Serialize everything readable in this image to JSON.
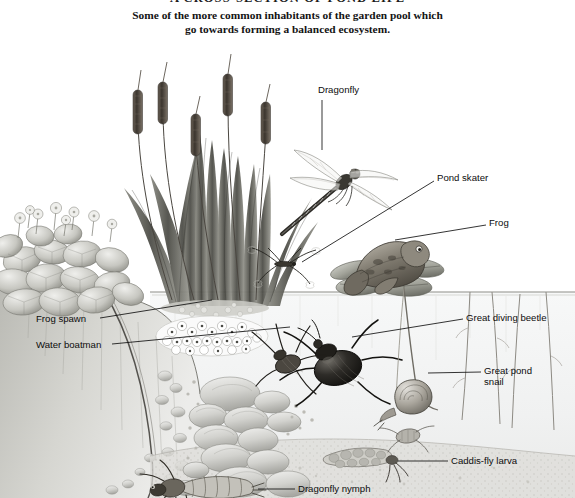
{
  "heading": {
    "title": "A CROSS-SECTION OF POND LIFE",
    "subtitle_line1": "Some of the more common inhabitants of the garden pool which",
    "subtitle_line2": "go towards forming a balanced ecosystem."
  },
  "labels": [
    {
      "id": "dragonfly",
      "text": "Dragonfly",
      "x": 318,
      "y": 90,
      "align": "left"
    },
    {
      "id": "pond-skater",
      "text": "Pond skater",
      "x": 437,
      "y": 175,
      "align": "left"
    },
    {
      "id": "frog",
      "text": "Frog",
      "x": 489,
      "y": 219,
      "align": "left"
    },
    {
      "id": "great-diving-beetle",
      "text": "Great diving beetle",
      "x": 466,
      "y": 313,
      "align": "left"
    },
    {
      "id": "great-pond-snail",
      "text": "Great pond\nsnail",
      "x": 484,
      "y": 366,
      "align": "left"
    },
    {
      "id": "caddis-fly-larva",
      "text": "Caddis-fly larva",
      "x": 451,
      "y": 456,
      "align": "left"
    },
    {
      "id": "dragonfly-nymph",
      "text": "Dragonfly nymph",
      "x": 298,
      "y": 484,
      "align": "left"
    },
    {
      "id": "frog-spawn",
      "text": "Frog spawn",
      "x": 36,
      "y": 315,
      "align": "left"
    },
    {
      "id": "water-boatman",
      "text": "Water boatman",
      "x": 36,
      "y": 341,
      "align": "left"
    }
  ],
  "leaders": [
    {
      "id": "leader-dragonfly",
      "x1": 322,
      "y1": 100,
      "x2": 322,
      "y2": 150
    },
    {
      "id": "leader-pond-skater",
      "x1": 434,
      "y1": 181,
      "x2": 302,
      "y2": 262
    },
    {
      "id": "leader-frog",
      "x1": 486,
      "y1": 225,
      "x2": 395,
      "y2": 240
    },
    {
      "id": "leader-great-diving-beetle",
      "x1": 463,
      "y1": 319,
      "x2": 352,
      "y2": 337
    },
    {
      "id": "leader-great-pond-snail",
      "x1": 481,
      "y1": 372,
      "x2": 428,
      "y2": 373
    },
    {
      "id": "leader-caddis-fly-larva",
      "x1": 448,
      "y1": 461,
      "x2": 398,
      "y2": 461
    },
    {
      "id": "leader-dragonfly-nymph",
      "x1": 295,
      "y1": 489,
      "x2": 258,
      "y2": 489
    },
    {
      "id": "leader-frog-spawn",
      "x1": 100,
      "y1": 318,
      "x2": 212,
      "y2": 300
    },
    {
      "id": "leader-water-boatman",
      "x1": 112,
      "y1": 344,
      "x2": 290,
      "y2": 327
    }
  ],
  "scene": {
    "medium": "pencil-illustration",
    "water_surface_y": 292,
    "bank_description": "sloping stony pond bank on left",
    "elements": [
      {
        "id": "bulrushes",
        "name": "bulrush-reeds",
        "description": "tall cattail reeds with brown seed heads emerging above water"
      },
      {
        "id": "marsh-marigold",
        "name": "marsh-marigold-plant",
        "description": "clump of round leaves with small flowers at left bank"
      },
      {
        "id": "lily-pads",
        "name": "water-lily-pads",
        "description": "floating lily pads at right on water surface"
      },
      {
        "id": "frog-spawn-mass",
        "name": "frog-spawn-mass",
        "description": "cluster of jelly eggs just under surface at left"
      },
      {
        "id": "pebbles",
        "name": "pebble-bed",
        "description": "rounded stones lining the pond floor"
      },
      {
        "id": "pond-weed",
        "name": "submerged-pond-weed",
        "description": "thin vertical stems rising from floor on the right"
      }
    ]
  },
  "colors": {
    "ink": "#2b2b2b",
    "paper": "#ffffff",
    "water_tint": "#f2f3f3",
    "sediment": "#d9d9d6",
    "stone": "#c9c9c6",
    "label_text": "#0d0d0d",
    "leader_line": "#111111"
  }
}
